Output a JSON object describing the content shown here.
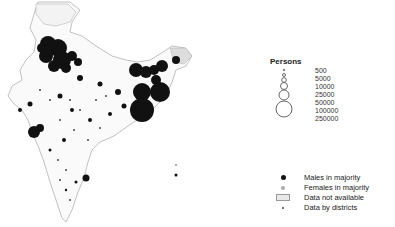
{
  "map": {
    "region": "India",
    "boundaries": "districts",
    "symbol": "proportional circles"
  },
  "legend": {
    "title": "Persons",
    "sizes": [
      {
        "label": "500",
        "r": 0.8
      },
      {
        "label": "5000",
        "r": 1.5
      },
      {
        "label": "10000",
        "r": 2.3
      },
      {
        "label": "25000",
        "r": 3.5
      },
      {
        "label": "50000",
        "r": 5
      },
      {
        "label": "100000",
        "r": 7
      },
      {
        "label": "250000",
        "r": 10
      }
    ],
    "keys": [
      {
        "label": "Males in majority",
        "symbol": "black-dot"
      },
      {
        "label": "Females in majority",
        "symbol": "grey-dot"
      },
      {
        "label": "Data not available",
        "symbol": "hatched-box"
      },
      {
        "label": "Data by districts",
        "symbol": "small-dot"
      }
    ]
  },
  "colors": {
    "male": "#111111",
    "female": "#aaaaaa",
    "outline": "#888888"
  }
}
